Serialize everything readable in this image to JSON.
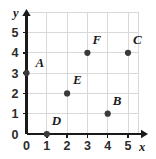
{
  "chart_data": {
    "type": "scatter",
    "title": "",
    "xlabel": "x",
    "ylabel": "y",
    "xlim": [
      0,
      5.5
    ],
    "ylim": [
      0,
      6
    ],
    "grid": true,
    "legend": false,
    "x_ticks": [
      "0",
      "1",
      "2",
      "3",
      "4",
      "5"
    ],
    "x_tick_values": [
      0,
      1,
      2,
      3,
      4,
      5
    ],
    "y_ticks": [
      "0",
      "1",
      "2",
      "3",
      "4",
      "5"
    ],
    "y_tick_values": [
      0,
      1,
      2,
      3,
      4,
      5
    ],
    "points": [
      {
        "label": "A",
        "x": 0,
        "y": 3,
        "label_dx": 9,
        "label_dy": -6
      },
      {
        "label": "E",
        "x": 2,
        "y": 2,
        "label_dx": 6,
        "label_dy": -9
      },
      {
        "label": "D",
        "x": 1,
        "y": 0,
        "label_dx": 5,
        "label_dy": -9
      },
      {
        "label": "B",
        "x": 4,
        "y": 1,
        "label_dx": 5,
        "label_dy": -9
      },
      {
        "label": "F",
        "x": 3,
        "y": 4,
        "label_dx": 5,
        "label_dy": -9
      },
      {
        "label": "C",
        "x": 5,
        "y": 4,
        "label_dx": 5,
        "label_dy": -9
      }
    ],
    "point_color": "#3a3a3a",
    "grid_color": "#d9d9d9",
    "axis_color": "#1a1a1a"
  },
  "axes": {
    "x_name": "x",
    "y_name": "y"
  }
}
